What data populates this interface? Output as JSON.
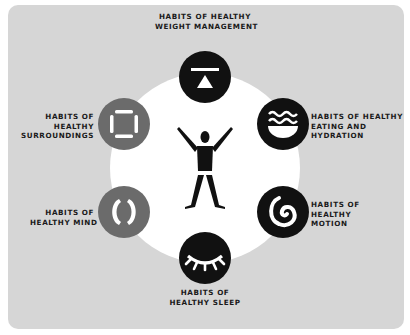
{
  "colors": {
    "panel_bg": "#d6d6d6",
    "hub_bg": "#ffffff",
    "dark_icon": "#111111",
    "gray_icon": "#6b6b6b",
    "text": "#1a1a1a"
  },
  "center": {
    "icon": "person-arms-raised-icon"
  },
  "habits": [
    {
      "id": "weight",
      "icon": "weight-scale-icon",
      "color": "dark",
      "label_lines": [
        "HABITS OF HEALTHY",
        "WEIGHT MANAGEMENT"
      ]
    },
    {
      "id": "eating",
      "icon": "bowl-water-waves-icon",
      "color": "dark",
      "label_lines": [
        "HABITS OF HEALTHY",
        "EATING AND",
        "HYDRATION"
      ]
    },
    {
      "id": "motion",
      "icon": "spiral-icon",
      "color": "dark",
      "label_lines": [
        "HABITS OF",
        "HEALTHY",
        "MOTION"
      ]
    },
    {
      "id": "sleep",
      "icon": "closed-eye-lashes-icon",
      "color": "dark",
      "label_lines": [
        "HABITS OF",
        "HEALTHY SLEEP"
      ]
    },
    {
      "id": "mind",
      "icon": "brackets-circle-icon",
      "color": "gray",
      "label_lines": [
        "HABITS OF",
        "HEALTHY MIND"
      ]
    },
    {
      "id": "surroundings",
      "icon": "square-frame-icon",
      "color": "gray",
      "label_lines": [
        "HABITS OF",
        "HEALTHY",
        "SURROUNDINGS"
      ]
    }
  ]
}
